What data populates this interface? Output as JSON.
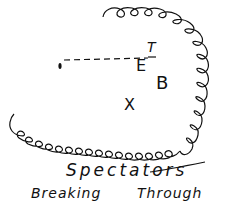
{
  "diagram": {
    "labels": {
      "t": "T",
      "e": "E",
      "b": "B",
      "x": "X"
    },
    "caption": {
      "line1": "Spectators",
      "line2_left": "Breaking",
      "line2_right": "Through"
    },
    "elements": {
      "ball_marker": "small oval marker at left end of dashed line",
      "dashed_line": "dashed line from marker to E",
      "spectator_loops": "looped curly line representing crowd of spectators around right and bottom"
    }
  }
}
